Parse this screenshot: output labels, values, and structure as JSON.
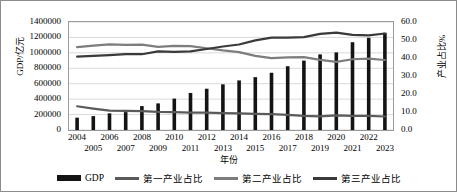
{
  "chart_data": {
    "type": "bar",
    "title": "",
    "subtitle": "",
    "xlabel": "年份",
    "ylabel": "GDP/亿元",
    "y2label": "产业占比%",
    "grid": true,
    "legend_position": "bottom",
    "categories": [
      "2004",
      "2005",
      "2006",
      "2007",
      "2008",
      "2009",
      "2010",
      "2011",
      "2012",
      "2013",
      "2014",
      "2015",
      "2016",
      "2017",
      "2018",
      "2019",
      "2020",
      "2021",
      "2022",
      "2023"
    ],
    "ylim": [
      0,
      1400000
    ],
    "yticks": [
      "0",
      "200000",
      "400000",
      "600000",
      "800000",
      "1000000",
      "1200000",
      "1400000"
    ],
    "y2lim": [
      0,
      60
    ],
    "y2ticks": [
      "0.0",
      "10.0",
      "20.0",
      "30.0",
      "40.0",
      "50.0",
      "60.0"
    ],
    "series": [
      {
        "name": "GDP",
        "type": "bar",
        "axis": "left",
        "color": "#141414",
        "values": [
          160000,
          180000,
          216000,
          232000,
          310000,
          345000,
          407000,
          480000,
          535000,
          592000,
          643000,
          685000,
          742000,
          827000,
          900000,
          980000,
          1006000,
          1138000,
          1195000,
          1260000
        ]
      },
      {
        "name": "第一产业占比",
        "type": "line",
        "axis": "right",
        "color": "#5a5a5a",
        "values": [
          13.2,
          11.9,
          10.8,
          10.6,
          10.5,
          10.1,
          9.9,
          9.7,
          9.6,
          9.4,
          9.2,
          9.0,
          8.8,
          8.4,
          7.9,
          7.6,
          8.1,
          7.9,
          7.8,
          7.5
        ]
      },
      {
        "name": "第二产业占比",
        "type": "line",
        "axis": "right",
        "color": "#7d7d7d",
        "values": [
          46.0,
          46.9,
          47.6,
          47.3,
          47.4,
          46.2,
          46.7,
          46.6,
          45.4,
          44.2,
          43.3,
          41.2,
          39.9,
          40.3,
          40.5,
          39.0,
          37.8,
          39.3,
          39.6,
          38.9
        ]
      },
      {
        "name": "第三产业占比",
        "type": "line",
        "axis": "right",
        "color": "#3a3a3a",
        "values": [
          40.8,
          41.2,
          41.6,
          42.1,
          42.1,
          43.7,
          43.4,
          43.7,
          45.0,
          46.4,
          47.5,
          49.8,
          51.3,
          51.3,
          51.6,
          53.4,
          54.1,
          52.8,
          52.6,
          53.6
        ]
      }
    ]
  },
  "axes": {
    "y_left_title": "GDP/亿元",
    "y_right_title": "产业占比%",
    "x_title": "年份"
  },
  "legend": {
    "items": [
      {
        "label": "GDP",
        "marker": "bar-swatch",
        "color": "#141414"
      },
      {
        "label": "第一产业占比",
        "marker": "line-swatch",
        "color": "#5a5a5a"
      },
      {
        "label": "第二产业占比",
        "marker": "line-swatch",
        "color": "#7d7d7d"
      },
      {
        "label": "第三产业占比",
        "marker": "line-swatch",
        "color": "#3a3a3a"
      }
    ]
  }
}
